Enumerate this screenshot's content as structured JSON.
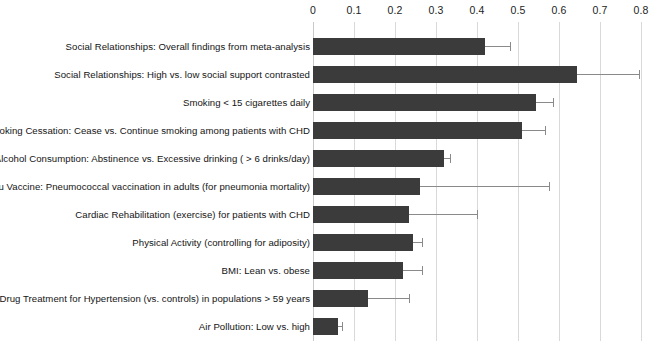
{
  "chart_data": {
    "type": "bar",
    "orientation": "horizontal",
    "title": "",
    "xlabel": "",
    "ylabel": "",
    "xlim": [
      0,
      0.8
    ],
    "grid": true,
    "legend": null,
    "axis_position": "top",
    "xticks": [
      0,
      0.1,
      0.2,
      0.3,
      0.4,
      0.5,
      0.6,
      0.7,
      0.8
    ],
    "xtick_labels": [
      "0",
      "0.1",
      "0.2",
      "0.3",
      "0.4",
      "0.5",
      "0.6",
      "0.7",
      "0.8"
    ],
    "bar_color": "#3b3b3b",
    "error_color": "#8a8a8a",
    "categories": [
      "Social Relationships: Overall findings from meta-analysis",
      "Social Relationships: High vs. low social support contrasted",
      "Smoking < 15 cigarettes daily",
      "Smoking Cessation: Cease vs. Continue smoking among patients with CHD",
      "Alcohol Consumption: Abstinence vs. Excessive drinking ( > 6 drinks/day)",
      "Flu Vaccine: Pneumococcal vaccination in adults (for pneumonia mortality)",
      "Cardiac Rehabilitation (exercise) for patients with CHD",
      "Physical Activity (controlling for adiposity)",
      "BMI: Lean vs. obese",
      "Drug Treatment for Hypertension (vs. controls) in populations > 59 years",
      "Air Pollution: Low vs. high"
    ],
    "values": [
      0.42,
      0.645,
      0.545,
      0.51,
      0.32,
      0.26,
      0.235,
      0.245,
      0.22,
      0.135,
      0.06
    ],
    "error_upper": [
      0.48,
      0.795,
      0.585,
      0.565,
      0.335,
      0.575,
      0.4,
      0.265,
      0.265,
      0.235,
      0.07
    ]
  }
}
